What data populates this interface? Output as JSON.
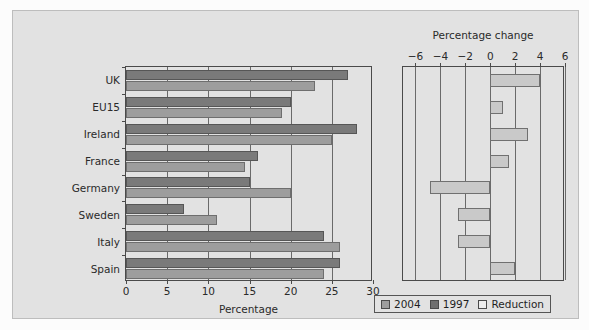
{
  "chart_data": {
    "type": "bar",
    "title": "",
    "panels": [
      {
        "name": "left",
        "orientation": "horizontal",
        "xlabel": "Percentage",
        "ylabel": "",
        "xlim": [
          0,
          30
        ],
        "xticks": [
          0,
          5,
          10,
          15,
          20,
          25,
          30
        ],
        "xticklabels": [
          "0",
          "5",
          "10",
          "15",
          "20",
          "25",
          "30"
        ],
        "grid": true,
        "categories": [
          "UK",
          "EU15",
          "Ireland",
          "France",
          "Germany",
          "Sweden",
          "Italy",
          "Spain"
        ],
        "series": [
          {
            "name": "1997",
            "color": "#7a7a7a",
            "values": [
              27.0,
              20.0,
              28.0,
              16.0,
              15.0,
              7.0,
              24.0,
              26.0
            ]
          },
          {
            "name": "2004",
            "color": "#9d9d9d",
            "values": [
              23.0,
              19.0,
              25.0,
              14.5,
              20.0,
              11.0,
              26.0,
              24.0
            ]
          }
        ]
      },
      {
        "name": "right",
        "orientation": "horizontal",
        "xlabel": "Percentage change",
        "ylabel": "",
        "xlim": [
          -7,
          6
        ],
        "xticks": [
          -6,
          -4,
          -2,
          0,
          2,
          4,
          6
        ],
        "xticklabels": [
          "−6",
          "−4",
          "−2",
          "0",
          "2",
          "4",
          "6"
        ],
        "axis_position": "top",
        "grid": true,
        "categories": [
          "UK",
          "EU15",
          "Ireland",
          "France",
          "Germany",
          "Sweden",
          "Italy",
          "Spain"
        ],
        "series": [
          {
            "name": "Reduction",
            "color": "#c9c9c9",
            "values": [
              4.0,
              1.0,
              3.0,
              1.5,
              -4.8,
              -2.6,
              -2.6,
              2.0
            ]
          }
        ]
      }
    ],
    "legend": {
      "position": "bottom-right",
      "entries": [
        {
          "label": "2004",
          "color": "#9d9d9d"
        },
        {
          "label": "1997",
          "color": "#6f6f6f"
        },
        {
          "label": "Reduction",
          "color": "#ececec"
        }
      ]
    }
  },
  "left": {
    "xtitle": "Percentage",
    "xticklabels": [
      "0",
      "5",
      "10",
      "15",
      "20",
      "25"
    ],
    "label30": "30",
    "categories": [
      "UK",
      "EU15",
      "Ireland",
      "France",
      "Germany",
      "Sweden",
      "Italy",
      "Spain"
    ]
  },
  "right": {
    "xtitle": "Percentage change",
    "xticklabels": [
      "−6",
      "−4",
      "−2",
      "0",
      "2",
      "4",
      "6"
    ]
  },
  "legend": {
    "entries": [
      "2004",
      "1997",
      "Reduction"
    ]
  }
}
